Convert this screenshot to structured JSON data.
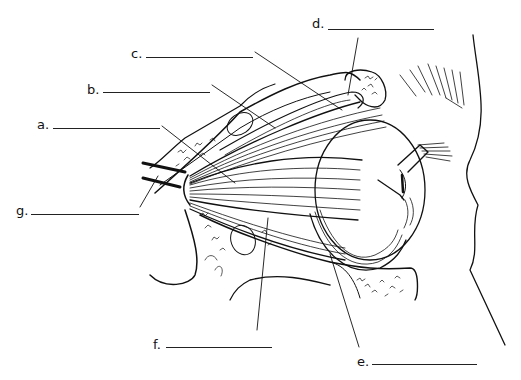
{
  "diagram": {
    "labels": [
      {
        "id": "a",
        "text": "a.",
        "x": 37,
        "y": 118,
        "blank_x1": 53,
        "blank_x2": 160,
        "blank_y": 128
      },
      {
        "id": "b",
        "text": "b.",
        "x": 87,
        "y": 83,
        "blank_x1": 103,
        "blank_x2": 210,
        "blank_y": 92
      },
      {
        "id": "c",
        "text": "c.",
        "x": 131,
        "y": 47,
        "blank_x1": 146,
        "blank_x2": 253,
        "blank_y": 57
      },
      {
        "id": "d",
        "text": "d.",
        "x": 312,
        "y": 17,
        "blank_x1": 328,
        "blank_x2": 434,
        "blank_y": 29
      },
      {
        "id": "e",
        "text": "e.",
        "x": 357,
        "y": 357,
        "blank_x1": 372,
        "blank_x2": 477,
        "blank_y": 364
      },
      {
        "id": "f",
        "text": "f.",
        "x": 153,
        "y": 340,
        "blank_x1": 166,
        "blank_x2": 272,
        "blank_y": 347
      },
      {
        "id": "g",
        "text": "g.",
        "x": 16,
        "y": 204,
        "blank_x1": 31,
        "blank_x2": 139,
        "blank_y": 214
      }
    ]
  }
}
